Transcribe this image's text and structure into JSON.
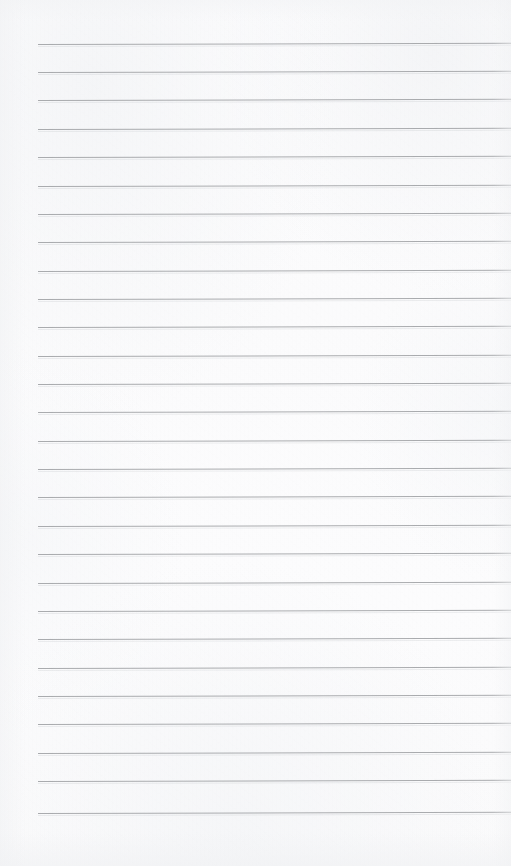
{
  "document": {
    "kind": "lined-notepad-page",
    "title": "Blank ruled notepad page",
    "page_label": "",
    "content_text": "",
    "is_blank": true
  },
  "paper": {
    "background_color": "#fcfcfd",
    "texture": "subtle paper grain",
    "width_px": 511,
    "height_px": 866
  },
  "rules": {
    "line_color": "#a1a3a6",
    "line_thickness_px": 1,
    "left_margin_px": 38,
    "right_edge_px": 511,
    "first_line_y_px": 44,
    "spacing_px": 28.5,
    "count": 28,
    "tilt_degrees": -0.16,
    "lines": [
      {
        "index": 1,
        "y": 44
      },
      {
        "index": 2,
        "y": 72
      },
      {
        "index": 3,
        "y": 100
      },
      {
        "index": 4,
        "y": 129
      },
      {
        "index": 5,
        "y": 157
      },
      {
        "index": 6,
        "y": 186
      },
      {
        "index": 7,
        "y": 214
      },
      {
        "index": 8,
        "y": 242
      },
      {
        "index": 9,
        "y": 271
      },
      {
        "index": 10,
        "y": 299
      },
      {
        "index": 11,
        "y": 327
      },
      {
        "index": 12,
        "y": 356
      },
      {
        "index": 13,
        "y": 384
      },
      {
        "index": 14,
        "y": 412
      },
      {
        "index": 15,
        "y": 441
      },
      {
        "index": 16,
        "y": 469
      },
      {
        "index": 17,
        "y": 497
      },
      {
        "index": 18,
        "y": 526
      },
      {
        "index": 19,
        "y": 554
      },
      {
        "index": 20,
        "y": 583
      },
      {
        "index": 21,
        "y": 611
      },
      {
        "index": 22,
        "y": 639
      },
      {
        "index": 23,
        "y": 668
      },
      {
        "index": 24,
        "y": 696
      },
      {
        "index": 25,
        "y": 724
      },
      {
        "index": 26,
        "y": 753
      },
      {
        "index": 27,
        "y": 781
      },
      {
        "index": 28,
        "y": 813
      }
    ]
  },
  "margins": {
    "top_blank_height_px": 44,
    "bottom_blank_height_px": 53,
    "left_blank_width_px": 38
  }
}
